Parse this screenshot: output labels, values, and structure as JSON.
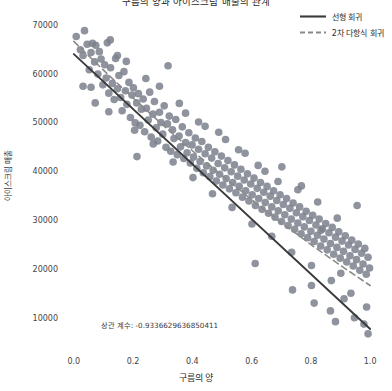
{
  "chart_data": {
    "type": "scatter",
    "title": "구름의 양과 아이스크림 매출의 관계",
    "xlabel": "구름의 양",
    "ylabel": "아이스크림 매출",
    "xlim": [
      -0.04,
      1.04
    ],
    "ylim": [
      4000,
      72000
    ],
    "xticks": [
      0.0,
      0.2,
      0.4,
      0.6,
      0.8,
      1.0
    ],
    "xticklabels": [
      "0.0",
      "0.2",
      "0.4",
      "0.6",
      "0.8",
      "1.0"
    ],
    "yticks": [
      10000,
      20000,
      30000,
      40000,
      50000,
      60000,
      70000
    ],
    "yticklabels": [
      "10000",
      "20000",
      "30000",
      "40000",
      "50000",
      "60000",
      "70000"
    ],
    "grid": false,
    "legend_position": "upper right",
    "annotation": "상관 계수: -0.9336629636850411",
    "annotation_x": 0.09,
    "annotation_y": 9000,
    "correlation": -0.9336629636850411,
    "marker_color": "#7b808c",
    "marker_size": 5.2,
    "marker_alpha": 0.85,
    "legend": [
      {
        "name": "선형 회귀",
        "style": "solid",
        "color": "#3a3a3a",
        "width": 1.9
      },
      {
        "name": "2차 다항식 회귀",
        "style": "dashed",
        "color": "#8a8a8a",
        "width": 1.6
      }
    ],
    "series": [
      {
        "name": "선형 회귀",
        "type": "line",
        "style": "solid",
        "color": "#3a3a3a",
        "x": [
          0.0,
          1.0
        ],
        "y": [
          64200,
          7900
        ]
      },
      {
        "name": "2차 다항식 회귀",
        "type": "line",
        "style": "dashed",
        "color": "#8a8a8a",
        "x": [
          0.0,
          0.1,
          0.2,
          0.3,
          0.4,
          0.5,
          0.6,
          0.7,
          0.8,
          0.9,
          1.0
        ],
        "y": [
          66800,
          60900,
          55200,
          49700,
          44400,
          39300,
          34400,
          29700,
          25200,
          20900,
          16800
        ]
      }
    ],
    "points": [
      [
        0.008,
        67800
      ],
      [
        0.022,
        65100
      ],
      [
        0.031,
        63900
      ],
      [
        0.036,
        69000
      ],
      [
        0.045,
        66200
      ],
      [
        0.052,
        61000
      ],
      [
        0.058,
        64500
      ],
      [
        0.063,
        66400
      ],
      [
        0.07,
        62600
      ],
      [
        0.074,
        66000
      ],
      [
        0.081,
        60100
      ],
      [
        0.086,
        64700
      ],
      [
        0.092,
        63200
      ],
      [
        0.098,
        57900
      ],
      [
        0.104,
        62000
      ],
      [
        0.109,
        59300
      ],
      [
        0.113,
        66500
      ],
      [
        0.118,
        56200
      ],
      [
        0.124,
        61400
      ],
      [
        0.13,
        58200
      ],
      [
        0.136,
        54900
      ],
      [
        0.141,
        63300
      ],
      [
        0.147,
        57100
      ],
      [
        0.152,
        59800
      ],
      [
        0.158,
        55300
      ],
      [
        0.163,
        52600
      ],
      [
        0.169,
        60600
      ],
      [
        0.174,
        56700
      ],
      [
        0.179,
        53900
      ],
      [
        0.186,
        58400
      ],
      [
        0.191,
        51200
      ],
      [
        0.196,
        55800
      ],
      [
        0.201,
        57300
      ],
      [
        0.207,
        50100
      ],
      [
        0.212,
        54200
      ],
      [
        0.218,
        56100
      ],
      [
        0.223,
        49600
      ],
      [
        0.228,
        52900
      ],
      [
        0.234,
        55000
      ],
      [
        0.239,
        48300
      ],
      [
        0.245,
        53100
      ],
      [
        0.251,
        50700
      ],
      [
        0.256,
        56400
      ],
      [
        0.261,
        47200
      ],
      [
        0.267,
        51900
      ],
      [
        0.272,
        54500
      ],
      [
        0.278,
        49100
      ],
      [
        0.283,
        46400
      ],
      [
        0.289,
        52300
      ],
      [
        0.294,
        50200
      ],
      [
        0.3,
        47800
      ],
      [
        0.305,
        53600
      ],
      [
        0.311,
        45100
      ],
      [
        0.316,
        49900
      ],
      [
        0.322,
        51500
      ],
      [
        0.327,
        44300
      ],
      [
        0.333,
        48700
      ],
      [
        0.338,
        46900
      ],
      [
        0.344,
        50800
      ],
      [
        0.349,
        43600
      ],
      [
        0.355,
        47400
      ],
      [
        0.36,
        45200
      ],
      [
        0.366,
        49300
      ],
      [
        0.371,
        42800
      ],
      [
        0.377,
        46100
      ],
      [
        0.382,
        44000
      ],
      [
        0.388,
        48100
      ],
      [
        0.393,
        41900
      ],
      [
        0.399,
        45600
      ],
      [
        0.404,
        43100
      ],
      [
        0.41,
        47000
      ],
      [
        0.415,
        40800
      ],
      [
        0.421,
        44700
      ],
      [
        0.426,
        42200
      ],
      [
        0.432,
        46300
      ],
      [
        0.437,
        39900
      ],
      [
        0.443,
        43800
      ],
      [
        0.448,
        41300
      ],
      [
        0.454,
        45100
      ],
      [
        0.459,
        39100
      ],
      [
        0.465,
        42900
      ],
      [
        0.47,
        40400
      ],
      [
        0.476,
        44200
      ],
      [
        0.481,
        38200
      ],
      [
        0.487,
        41800
      ],
      [
        0.492,
        39600
      ],
      [
        0.498,
        43300
      ],
      [
        0.503,
        37400
      ],
      [
        0.509,
        40900
      ],
      [
        0.514,
        38700
      ],
      [
        0.52,
        42400
      ],
      [
        0.525,
        36600
      ],
      [
        0.531,
        40100
      ],
      [
        0.536,
        37900
      ],
      [
        0.542,
        41500
      ],
      [
        0.547,
        35800
      ],
      [
        0.553,
        39200
      ],
      [
        0.558,
        37100
      ],
      [
        0.564,
        40600
      ],
      [
        0.569,
        34900
      ],
      [
        0.575,
        38400
      ],
      [
        0.58,
        36200
      ],
      [
        0.586,
        39700
      ],
      [
        0.591,
        34100
      ],
      [
        0.597,
        37600
      ],
      [
        0.602,
        35400
      ],
      [
        0.608,
        38800
      ],
      [
        0.613,
        33200
      ],
      [
        0.619,
        36700
      ],
      [
        0.624,
        34600
      ],
      [
        0.63,
        37900
      ],
      [
        0.635,
        32400
      ],
      [
        0.641,
        35900
      ],
      [
        0.646,
        33800
      ],
      [
        0.652,
        37100
      ],
      [
        0.657,
        31600
      ],
      [
        0.663,
        35100
      ],
      [
        0.668,
        32900
      ],
      [
        0.674,
        36200
      ],
      [
        0.679,
        30800
      ],
      [
        0.685,
        34200
      ],
      [
        0.69,
        32100
      ],
      [
        0.696,
        35400
      ],
      [
        0.701,
        29900
      ],
      [
        0.707,
        33400
      ],
      [
        0.712,
        31300
      ],
      [
        0.718,
        34600
      ],
      [
        0.723,
        29100
      ],
      [
        0.729,
        32600
      ],
      [
        0.734,
        30400
      ],
      [
        0.74,
        33700
      ],
      [
        0.745,
        28300
      ],
      [
        0.751,
        31700
      ],
      [
        0.756,
        29600
      ],
      [
        0.762,
        32900
      ],
      [
        0.767,
        27400
      ],
      [
        0.773,
        30900
      ],
      [
        0.778,
        28800
      ],
      [
        0.784,
        32000
      ],
      [
        0.789,
        26600
      ],
      [
        0.795,
        30100
      ],
      [
        0.8,
        27900
      ],
      [
        0.806,
        31200
      ],
      [
        0.811,
        25800
      ],
      [
        0.817,
        29200
      ],
      [
        0.822,
        27100
      ],
      [
        0.828,
        30400
      ],
      [
        0.833,
        24900
      ],
      [
        0.839,
        28400
      ],
      [
        0.844,
        26300
      ],
      [
        0.85,
        29500
      ],
      [
        0.855,
        24100
      ],
      [
        0.861,
        27600
      ],
      [
        0.866,
        25400
      ],
      [
        0.872,
        28700
      ],
      [
        0.877,
        23200
      ],
      [
        0.883,
        26700
      ],
      [
        0.888,
        24600
      ],
      [
        0.894,
        27800
      ],
      [
        0.899,
        22400
      ],
      [
        0.905,
        25900
      ],
      [
        0.91,
        23800
      ],
      [
        0.916,
        27000
      ],
      [
        0.921,
        21600
      ],
      [
        0.927,
        25100
      ],
      [
        0.932,
        22900
      ],
      [
        0.938,
        26100
      ],
      [
        0.943,
        20800
      ],
      [
        0.949,
        24200
      ],
      [
        0.954,
        22100
      ],
      [
        0.96,
        25300
      ],
      [
        0.965,
        19900
      ],
      [
        0.971,
        23400
      ],
      [
        0.976,
        21200
      ],
      [
        0.982,
        24400
      ],
      [
        0.987,
        19100
      ],
      [
        0.993,
        22600
      ],
      [
        0.998,
        20400
      ],
      [
        0.118,
        52400
      ],
      [
        0.205,
        48600
      ],
      [
        0.268,
        45800
      ],
      [
        0.335,
        42100
      ],
      [
        0.402,
        38900
      ],
      [
        0.468,
        35600
      ],
      [
        0.534,
        32800
      ],
      [
        0.601,
        29400
      ],
      [
        0.668,
        26900
      ],
      [
        0.735,
        23600
      ],
      [
        0.802,
        20900
      ],
      [
        0.869,
        17800
      ],
      [
        0.935,
        15200
      ],
      [
        0.988,
        12400
      ],
      [
        0.058,
        57400
      ],
      [
        0.147,
        63900
      ],
      [
        0.213,
        43200
      ],
      [
        0.289,
        57600
      ],
      [
        0.356,
        54100
      ],
      [
        0.421,
        50300
      ],
      [
        0.489,
        48200
      ],
      [
        0.556,
        44600
      ],
      [
        0.622,
        41400
      ],
      [
        0.689,
        38100
      ],
      [
        0.756,
        36400
      ],
      [
        0.823,
        33900
      ],
      [
        0.889,
        30600
      ],
      [
        0.956,
        33200
      ],
      [
        0.612,
        21300
      ],
      [
        0.738,
        15900
      ],
      [
        0.811,
        13200
      ],
      [
        0.866,
        11600
      ],
      [
        0.912,
        14100
      ],
      [
        0.947,
        10200
      ],
      [
        0.979,
        8900
      ],
      [
        0.993,
        6900
      ],
      [
        0.883,
        9400
      ],
      [
        0.802,
        16800
      ],
      [
        0.031,
        57600
      ],
      [
        0.072,
        54200
      ],
      [
        0.123,
        67100
      ],
      [
        0.177,
        62700
      ],
      [
        0.243,
        59200
      ],
      [
        0.318,
        61800
      ],
      [
        0.377,
        52100
      ],
      [
        0.443,
        49400
      ],
      [
        0.512,
        46700
      ],
      [
        0.578,
        43900
      ],
      [
        0.645,
        40200
      ],
      [
        0.702,
        41100
      ],
      [
        0.768,
        37200
      ],
      [
        0.834,
        28100
      ],
      [
        0.901,
        19300
      ]
    ]
  }
}
